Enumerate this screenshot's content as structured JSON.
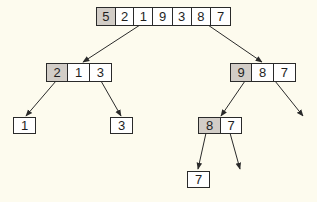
{
  "diagram": {
    "title": "",
    "background_color": "#fdfbee",
    "pivot_color": "#d2cdc7",
    "line_color": "#2a2a2a",
    "nodes": {
      "root": {
        "cells": [
          "5",
          "2",
          "1",
          "9",
          "3",
          "8",
          "7"
        ],
        "pivot_index": 0
      },
      "left": {
        "cells": [
          "2",
          "1",
          "3"
        ],
        "pivot_index": 0
      },
      "right": {
        "cells": [
          "9",
          "8",
          "7"
        ],
        "pivot_index": 0
      },
      "left_left": {
        "cells": [
          "1"
        ],
        "pivot_index": -1
      },
      "left_right": {
        "cells": [
          "3"
        ],
        "pivot_index": -1
      },
      "right_left": {
        "cells": [
          "8",
          "7"
        ],
        "pivot_index": 0
      },
      "right_left_left": {
        "cells": [
          "7"
        ],
        "pivot_index": -1
      }
    },
    "edges": [
      {
        "from": "root",
        "to": "left"
      },
      {
        "from": "root",
        "to": "right"
      },
      {
        "from": "left",
        "to": "left_left"
      },
      {
        "from": "left",
        "to": "left_right"
      },
      {
        "from": "right",
        "to": "right_left"
      },
      {
        "from": "right",
        "to": "empty"
      },
      {
        "from": "right_left",
        "to": "right_left_left"
      },
      {
        "from": "right_left",
        "to": "empty"
      }
    ]
  }
}
